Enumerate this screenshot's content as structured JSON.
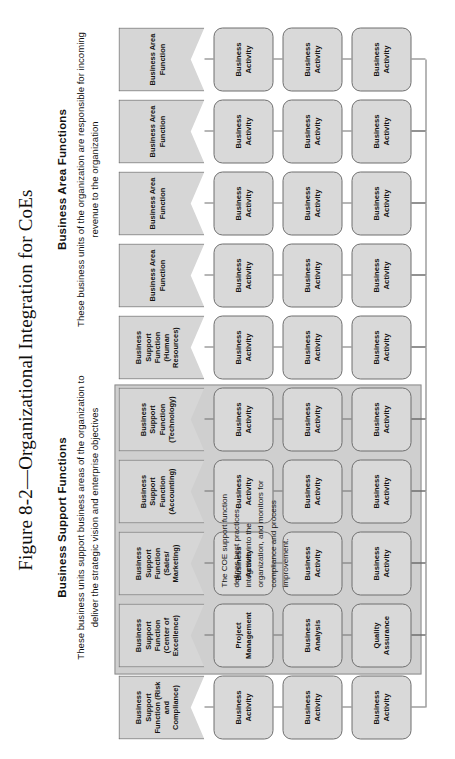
{
  "figure": {
    "title": "Figure 8-2—Organizational Integration for CoEs"
  },
  "headers": {
    "support": {
      "title": "Business Support Functions",
      "subtitle": "These business units support business areas of the organization to deliver the strategic vision and enterprise objectives"
    },
    "area": {
      "title": "Business Area Functions",
      "subtitle": "These business units of the organization are responsible for incoming revenue to the organization"
    }
  },
  "labels": {
    "business_activity": "Business\nActivity"
  },
  "coe_note": "The COE support function defines best practices, integrates into the organization, and monitors for compliance and process improvement.",
  "colors": {
    "box_fill": "#d9d9d9",
    "chevron_fill": "#d6d6d6",
    "highlight_fill": "#cfcfcf",
    "stroke": "#6f6f6f",
    "text": "#131211"
  },
  "columns": [
    {
      "id": "risk-and-compliance",
      "header": "Business Support Function (Risk and Compliance)",
      "highlight": false,
      "activities": [
        "Business Activity",
        "Business Activity",
        "Business Activity"
      ]
    },
    {
      "id": "center-of-excellence",
      "header": "Business Support Function (Center of Excellence)",
      "highlight": true,
      "activities": [
        "Project Management",
        "Business Analysis",
        "Quality Assurance"
      ]
    },
    {
      "id": "sales-marketing",
      "header": "Business Support Function (Sales/ Marketing)",
      "highlight": false,
      "activities": [
        "Business Activity",
        "Business Activity",
        "Business Activity"
      ]
    },
    {
      "id": "accounting",
      "header": "Business Support Function (Accounting)",
      "highlight": false,
      "activities": [
        "Business Activity",
        "Business Activity",
        "Business Activity"
      ]
    },
    {
      "id": "technology",
      "header": "Business Support Function (Technology)",
      "highlight": false,
      "activities": [
        "Business Activity",
        "Business Activity",
        "Business Activity"
      ]
    },
    {
      "id": "human-resources",
      "header": "Business Support Function (Human Resources)",
      "highlight": false,
      "activities": [
        "Business Activity",
        "Business Activity",
        "Business Activity"
      ]
    },
    {
      "id": "business-area-1",
      "header": "Business Area Function",
      "highlight": false,
      "activities": [
        "Business Activity",
        "Business Activity",
        "Business Activity"
      ]
    },
    {
      "id": "business-area-2",
      "header": "Business Area Function",
      "highlight": false,
      "activities": [
        "Business Activity",
        "Business Activity",
        "Business Activity"
      ]
    },
    {
      "id": "business-area-3",
      "header": "Business Area Function",
      "highlight": false,
      "activities": [
        "Business Activity",
        "Business Activity",
        "Business Activity"
      ]
    },
    {
      "id": "business-area-4",
      "header": "Business Area Function",
      "highlight": false,
      "activities": [
        "Business Activity",
        "Business Activity",
        "Business Activity"
      ]
    }
  ]
}
